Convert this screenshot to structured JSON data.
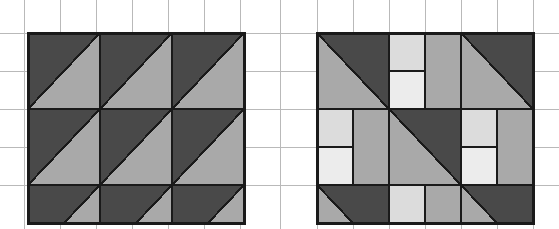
{
  "canvas": {
    "width": 559,
    "height": 229,
    "background": "#ffffff"
  },
  "colors": {
    "background": "#ffffff",
    "grid_line": "#b9b9b9",
    "outline": "#1a1a1a",
    "dark_gray": "#494949",
    "medium_gray": "#a9a9a9",
    "light_gray": "#ececec"
  },
  "grid": {
    "visible": true,
    "line_color": "#b9b9b9",
    "line_width": 1,
    "vertical_x": [
      24,
      60,
      96,
      132,
      168,
      204,
      240,
      280,
      317,
      353,
      389,
      425,
      461,
      497,
      533
    ],
    "horizontal_y": [
      33,
      71,
      109,
      147,
      185
    ],
    "horizontal_extent": [
      0,
      559
    ]
  },
  "patterns": [
    {
      "name": "left-pattern",
      "label": "Left tiling pattern",
      "origin_x": 28,
      "origin_y": 33,
      "cell_width": 72,
      "cell_height": 76,
      "columns": 3,
      "rows": 2.5,
      "outline_color": "#1a1a1a",
      "outline_width": 3,
      "motif": "half-square-triangle",
      "motif_description": "Each square cell is split by a diagonal running from bottom-left to top-right; the upper-left triangle is dark gray and the lower-right triangle is medium gray.",
      "tiles": [
        {
          "row": 0,
          "col": 0,
          "upper": "#494949",
          "lower": "#a9a9a9"
        },
        {
          "row": 0,
          "col": 1,
          "upper": "#494949",
          "lower": "#a9a9a9"
        },
        {
          "row": 0,
          "col": 2,
          "upper": "#494949",
          "lower": "#a9a9a9"
        },
        {
          "row": 1,
          "col": 0,
          "upper": "#494949",
          "lower": "#a9a9a9"
        },
        {
          "row": 1,
          "col": 1,
          "upper": "#494949",
          "lower": "#a9a9a9"
        },
        {
          "row": 1,
          "col": 2,
          "upper": "#494949",
          "lower": "#a9a9a9"
        },
        {
          "row": 2,
          "col": 0,
          "upper": "#494949",
          "lower": "#a9a9a9"
        },
        {
          "row": 2,
          "col": 1,
          "upper": "#494949",
          "lower": "#a9a9a9"
        },
        {
          "row": 2,
          "col": 2,
          "upper": "#494949",
          "lower": "#a9a9a9"
        }
      ]
    },
    {
      "name": "right-pattern",
      "label": "Right tiling pattern",
      "origin_x": 317,
      "origin_y": 33,
      "cell_width": 72,
      "cell_height": 76,
      "columns": 3,
      "rows": 2.5,
      "outline_color": "#1a1a1a",
      "outline_width": 3,
      "motif": "mixed-triangle-and-squares",
      "motif_description": "Alternating cells: triangle cells split top-left to bottom-right with dark gray above and medium gray below, paired with cells built from a medium-gray region and two stacked light-gray squares.",
      "tiles": [
        {
          "row": 0,
          "col": 0,
          "kind": "triangle",
          "upper": "#494949",
          "lower": "#a9a9a9"
        },
        {
          "row": 0,
          "col": 1,
          "kind": "squares",
          "base": "#a9a9a9",
          "squares": [
            "#dcdcdc",
            "#ececec"
          ]
        },
        {
          "row": 0,
          "col": 2,
          "kind": "triangle",
          "upper": "#494949",
          "lower": "#a9a9a9"
        },
        {
          "row": 1,
          "col": 0,
          "kind": "squares",
          "base": "#a9a9a9",
          "squares": [
            "#dcdcdc",
            "#ececec"
          ]
        },
        {
          "row": 1,
          "col": 1,
          "kind": "triangle",
          "upper": "#494949",
          "lower": "#a9a9a9"
        },
        {
          "row": 1,
          "col": 2,
          "kind": "squares",
          "base": "#a9a9a9",
          "squares": [
            "#dcdcdc",
            "#ececec"
          ]
        },
        {
          "row": 2,
          "col": 0,
          "kind": "triangle",
          "upper": "#494949",
          "lower": "#a9a9a9"
        },
        {
          "row": 2,
          "col": 1,
          "kind": "squares",
          "base": "#a9a9a9",
          "squares": [
            "#dcdcdc",
            "#ececec"
          ]
        },
        {
          "row": 2,
          "col": 2,
          "kind": "triangle",
          "upper": "#494949",
          "lower": "#a9a9a9"
        }
      ]
    }
  ]
}
